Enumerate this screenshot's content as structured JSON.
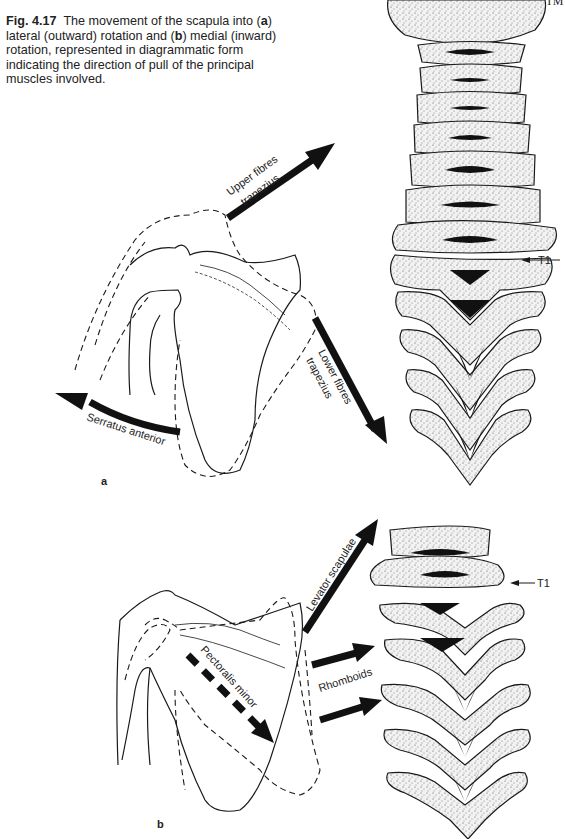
{
  "header": {
    "running_title": "THE UPPER LIM"
  },
  "caption": {
    "fig_label": "Fig. 4.17",
    "text_1": "The movement of the scapula into (",
    "a": "a",
    "text_2": ") lateral (outward) rotation and (",
    "b": "b",
    "text_3": ") medial (inward) rotation, represented in diagrammatic form indicating the direction of pull of the principal muscles involved."
  },
  "panel_a": {
    "label": "a",
    "muscles": {
      "upper_trapezius_1": "Upper fibres",
      "upper_trapezius_2": "trapezius",
      "lower_trapezius_1": "Lower fibres",
      "lower_trapezius_2": "trapezius",
      "serratus": "Serratus anterior"
    },
    "vertebra_marker": "T1"
  },
  "panel_b": {
    "label": "b",
    "muscles": {
      "levator": "Levator scapulae",
      "pectoralis": "Pectoralis minor",
      "rhomboids": "Rhomboids"
    },
    "vertebra_marker": "T1"
  },
  "colors": {
    "ink": "#1a1a1a",
    "bone_fill": "#ececec",
    "paper": "#ffffff"
  }
}
